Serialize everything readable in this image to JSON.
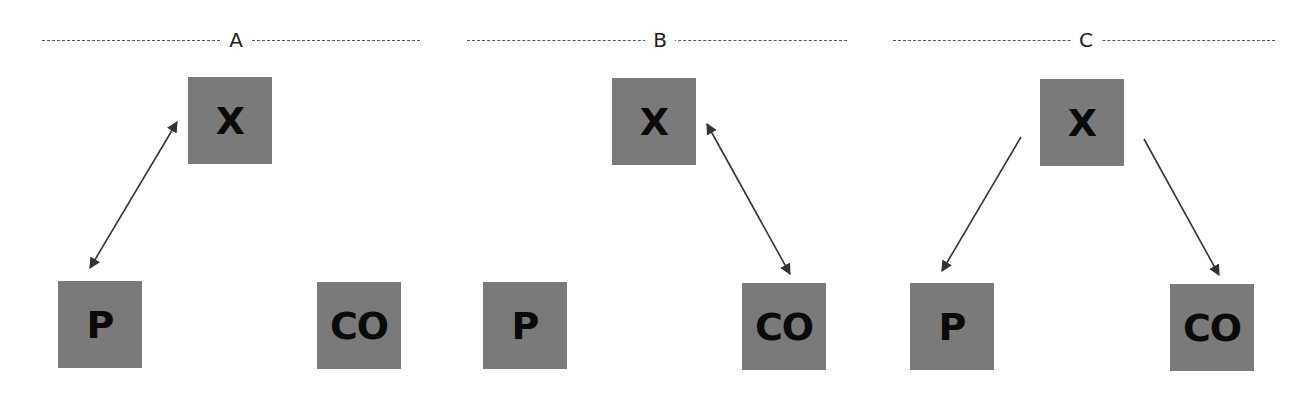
{
  "diagram": {
    "colors": {
      "node_fill": "#7a7a7a",
      "node_text": "#0a0a0a",
      "line": "#333333",
      "dash": "#555555"
    },
    "panels": [
      {
        "label": "A",
        "dash": {
          "x1": 42,
          "x2": 420,
          "label_x": 236
        },
        "nodes": [
          {
            "id": "X",
            "label": "X",
            "x": 188,
            "y": 77
          },
          {
            "id": "P",
            "label": "P",
            "x": 58,
            "y": 281
          },
          {
            "id": "CO",
            "label": "CO",
            "x": 317,
            "y": 282
          }
        ],
        "edges": [
          {
            "from": "X",
            "to": "P",
            "direction": "both",
            "x1": 177,
            "y1": 122,
            "x2": 90,
            "y2": 268
          }
        ]
      },
      {
        "label": "B",
        "dash": {
          "x1": 467,
          "x2": 847,
          "label_x": 660
        },
        "nodes": [
          {
            "id": "X",
            "label": "X",
            "x": 612,
            "y": 78
          },
          {
            "id": "P",
            "label": "P",
            "x": 483,
            "y": 282
          },
          {
            "id": "CO",
            "label": "CO",
            "x": 742,
            "y": 283
          }
        ],
        "edges": [
          {
            "from": "X",
            "to": "CO",
            "direction": "both",
            "x1": 707,
            "y1": 124,
            "x2": 790,
            "y2": 274
          }
        ]
      },
      {
        "label": "C",
        "dash": {
          "x1": 893,
          "x2": 1275,
          "label_x": 1086
        },
        "nodes": [
          {
            "id": "X",
            "label": "X",
            "x": 1040,
            "y": 79
          },
          {
            "id": "P",
            "label": "P",
            "x": 910,
            "y": 283
          },
          {
            "id": "CO",
            "label": "CO",
            "x": 1170,
            "y": 284
          }
        ],
        "edges": [
          {
            "from": "X",
            "to": "P",
            "direction": "forward",
            "x1": 1021,
            "y1": 137,
            "x2": 942,
            "y2": 271
          },
          {
            "from": "X",
            "to": "CO",
            "direction": "forward",
            "x1": 1144,
            "y1": 139,
            "x2": 1219,
            "y2": 275
          }
        ]
      }
    ]
  }
}
